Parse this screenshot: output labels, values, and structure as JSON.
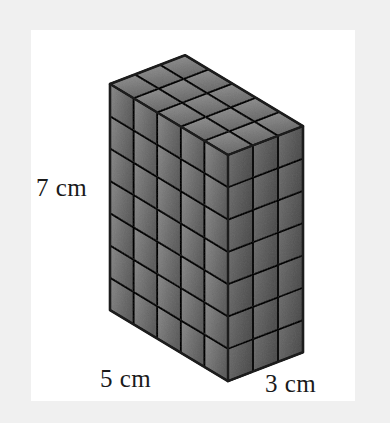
{
  "figure": {
    "kind": "isometric-unit-cube-prism",
    "background_color": "#f0f0f0",
    "card_color": "#ffffff",
    "cube_fill_top": "#b5b5b5",
    "cube_fill_left": "#a8a8a8",
    "cube_fill_right": "#9a9a9a",
    "cube_edge_color": "#2b2b2b",
    "outline_color": "#1c1c1c",
    "units": "cm",
    "dimensions": {
      "height": 7,
      "width": 5,
      "depth": 3
    },
    "cube_counts": {
      "left_face_columns": 5,
      "left_face_rows": 7,
      "right_face_columns": 3,
      "right_face_rows": 7,
      "top_face_columns": 5,
      "top_face_rows": 3,
      "total_cubes": 105
    },
    "labels": {
      "height": "7 cm",
      "width": "5 cm",
      "depth": "3 cm"
    },
    "label_positions": {
      "height": {
        "x": 36,
        "y": 196
      },
      "width": {
        "x": 100,
        "y": 387
      },
      "depth": {
        "x": 265,
        "y": 392
      }
    },
    "geometry": {
      "origin_x": 110,
      "origin_y": 84,
      "u_x": 23.6,
      "u_y": 14.2,
      "v_x": 25.0,
      "v_y": -9.6,
      "w_y": 32.3
    }
  }
}
